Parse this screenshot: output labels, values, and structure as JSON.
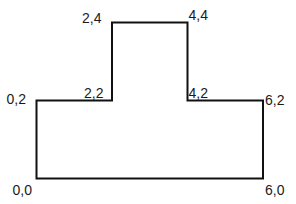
{
  "diagram": {
    "type": "polygon",
    "stroke_color": "#111111",
    "vertices": [
      {
        "x": 0,
        "y": 0,
        "label": "0,0"
      },
      {
        "x": 6,
        "y": 0,
        "label": "6,0"
      },
      {
        "x": 6,
        "y": 2,
        "label": "6,2"
      },
      {
        "x": 4,
        "y": 2,
        "label": "4,2"
      },
      {
        "x": 4,
        "y": 4,
        "label": "4,4"
      },
      {
        "x": 2,
        "y": 4,
        "label": "2,4"
      },
      {
        "x": 2,
        "y": 2,
        "label": "2,2"
      },
      {
        "x": 0,
        "y": 2,
        "label": "0,2"
      }
    ]
  }
}
